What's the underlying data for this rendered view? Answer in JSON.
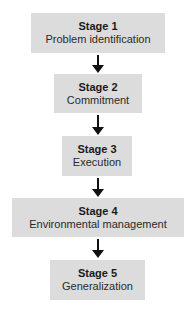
{
  "diagram": {
    "type": "vertical-flowchart",
    "colors": {
      "box_fill": "#dcdcdc",
      "arrow": "#111111",
      "background": "#ffffff"
    },
    "stages": [
      {
        "title": "Stage 1",
        "label": "Problem identification"
      },
      {
        "title": "Stage 2",
        "label": "Commitment"
      },
      {
        "title": "Stage 3",
        "label": "Execution"
      },
      {
        "title": "Stage 4",
        "label": "Environmental management"
      },
      {
        "title": "Stage 5",
        "label": "Generalization"
      }
    ],
    "edges": [
      {
        "from": "Stage 1",
        "to": "Stage 2"
      },
      {
        "from": "Stage 2",
        "to": "Stage 3"
      },
      {
        "from": "Stage 3",
        "to": "Stage 4"
      },
      {
        "from": "Stage 4",
        "to": "Stage 5"
      }
    ]
  }
}
